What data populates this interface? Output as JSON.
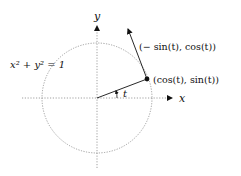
{
  "figure": {
    "type": "unit-circle-diagram",
    "circle_label": "x² + y² = 1",
    "axis_labels": {
      "x": "x",
      "y": "y"
    },
    "angle_label": "t",
    "point_label": "(cos(t), sin(t))",
    "tangent_label": "(− sin(t), cos(t))"
  },
  "colors": {
    "stroke": "#111111",
    "dotted": "#888888",
    "background": "#ffffff"
  }
}
